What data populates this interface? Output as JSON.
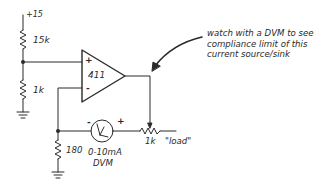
{
  "diagram": {
    "type": "circuit-schematic",
    "supply_label": "+15",
    "resistors": {
      "r_top": "15k",
      "r_bottom": "1k",
      "r_sense": "180",
      "r_load": "1k",
      "r_load_note": "\"load\""
    },
    "opamp": {
      "label": "411",
      "plus": "+",
      "minus": "-"
    },
    "meter": {
      "label_line1": "0-10mA",
      "label_line2": "DVM",
      "minus": "-",
      "plus": "+"
    },
    "annotation": {
      "line1": "watch with a DVM to see",
      "line2": "compliance limit of this",
      "line3": "current source/sink"
    },
    "colors": {
      "stroke": "#2a2a2a",
      "background": "#ffffff"
    }
  }
}
